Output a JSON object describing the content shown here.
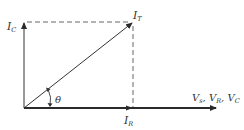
{
  "diagram": {
    "type": "phasor",
    "labels": {
      "ic": {
        "main": "I",
        "sub": "C"
      },
      "it": {
        "main": "I",
        "sub": "T"
      },
      "ir": {
        "main": "I",
        "sub": "R"
      },
      "theta": "θ",
      "v_axis": {
        "parts": [
          {
            "main": "V",
            "sub": "s"
          },
          {
            "main": "V",
            "sub": "R"
          },
          {
            "main": "V",
            "sub": "C"
          }
        ],
        "separator": ", "
      }
    },
    "colors": {
      "line": "#333333",
      "axis": "#2a2a2a",
      "dashed": "#666666"
    }
  }
}
